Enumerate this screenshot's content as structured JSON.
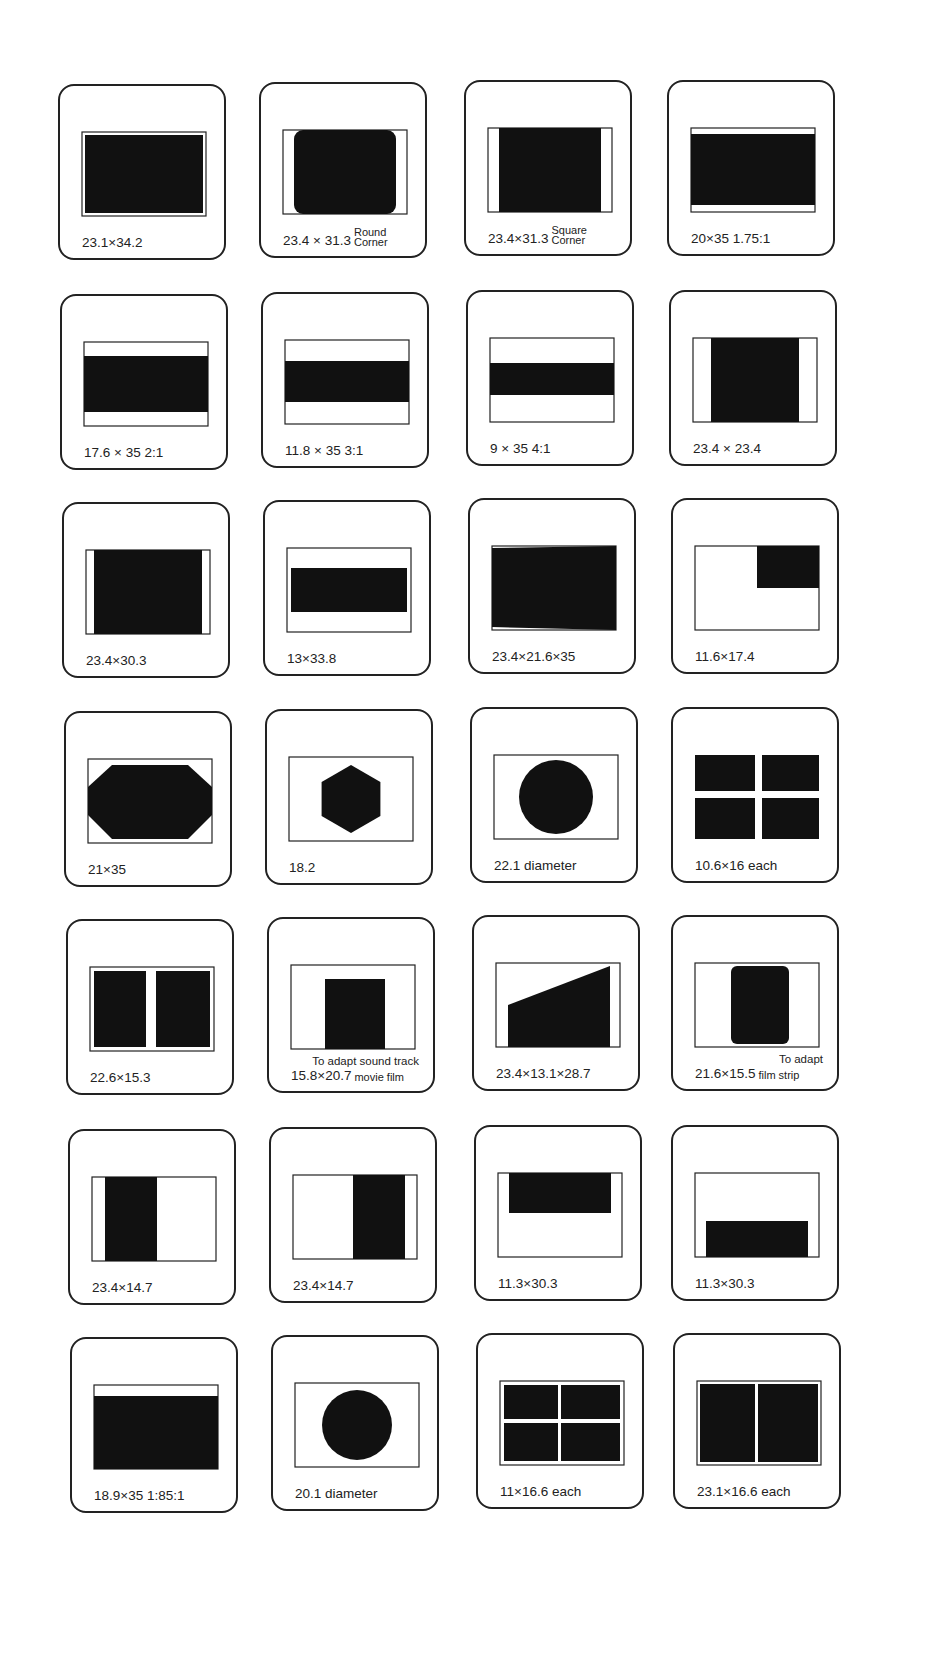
{
  "colors": {
    "ink": "#111111",
    "paper": "#ffffff",
    "outline": "#222222"
  },
  "mounts": [
    {
      "label": "23.1×34.2",
      "note": "",
      "shape": "full-rect"
    },
    {
      "label": "23.4 × 31.3",
      "note": "Round Corner",
      "shape": "round-corner"
    },
    {
      "label": "23.4×31.3",
      "note": "Square Corner",
      "shape": "square-corner"
    },
    {
      "label": "20×35  1.75:1",
      "note": "",
      "shape": "wide-175"
    },
    {
      "label": "17.6 × 35  2:1",
      "note": "",
      "shape": "wide-2"
    },
    {
      "label": "11.8 × 35  3:1",
      "note": "",
      "shape": "wide-3"
    },
    {
      "label": "9 × 35  4:1",
      "note": "",
      "shape": "wide-4"
    },
    {
      "label": "23.4 × 23.4",
      "note": "",
      "shape": "square"
    },
    {
      "label": "23.4×30.3",
      "note": "",
      "shape": "near-full"
    },
    {
      "label": "13×33.8",
      "note": "",
      "shape": "band-13"
    },
    {
      "label": "23.4×21.6×35",
      "note": "",
      "shape": "trapezoid"
    },
    {
      "label": "11.6×17.4",
      "note": "",
      "shape": "quarter-top-right"
    },
    {
      "label": "21×35",
      "note": "",
      "shape": "octagon"
    },
    {
      "label": "18.2",
      "note": "",
      "shape": "hexagon"
    },
    {
      "label": "22.1 diameter",
      "note": "",
      "shape": "circle-large"
    },
    {
      "label": "10.6×16 each",
      "note": "",
      "shape": "four-cross"
    },
    {
      "label": "22.6×15.3",
      "note": "",
      "shape": "two-vertical"
    },
    {
      "label": "15.8×20.7",
      "note": "movie film",
      "note_top": "To adapt sound track",
      "shape": "sound-track"
    },
    {
      "label": "23.4×13.1×28.7",
      "note": "",
      "shape": "wedge"
    },
    {
      "label": "21.6×15.5",
      "note": "film strip",
      "note_top": "To adapt",
      "shape": "film-strip"
    },
    {
      "label": "23.4×14.7",
      "note": "",
      "shape": "half-left"
    },
    {
      "label": "23.4×14.7",
      "note": "",
      "shape": "half-right"
    },
    {
      "label": "11.3×30.3",
      "note": "",
      "shape": "half-top"
    },
    {
      "label": "11.3×30.3",
      "note": "",
      "shape": "half-bottom"
    },
    {
      "label": "18.9×35  1:85:1",
      "note": "",
      "shape": "wide-185"
    },
    {
      "label": "20.1 diameter",
      "note": "",
      "shape": "circle-small"
    },
    {
      "label": "11×16.6 each",
      "note": "",
      "shape": "four-grid"
    },
    {
      "label": "23.1×16.6 each",
      "note": "",
      "shape": "two-split"
    }
  ]
}
